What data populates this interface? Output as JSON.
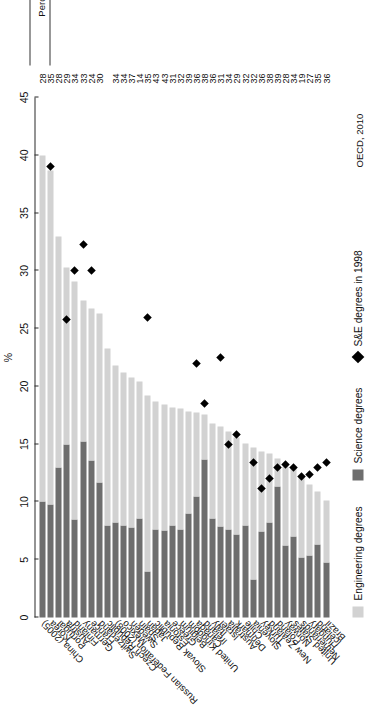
{
  "source_note": "OECD, 2010",
  "axis": {
    "unit": "%",
    "ticks": [
      0,
      5,
      10,
      15,
      20,
      25,
      30,
      35,
      40,
      45
    ],
    "min": 0,
    "max": 45
  },
  "legend": {
    "items": [
      {
        "label": "Engineering degrees",
        "marker": "light-square",
        "color": "#d2d2d2"
      },
      {
        "label": "Science degrees",
        "marker": "dark-square",
        "color": "#6e6e6e"
      },
      {
        "label": "S&E degrees in 1998",
        "marker": "diamond",
        "color": "#000000"
      }
    ]
  },
  "value_column": {
    "header": "Percentage of S&E degrees awarded to women"
  },
  "chart_data": {
    "type": "bar",
    "orientation": "horizontal-stacked",
    "title": "",
    "xlabel": "%",
    "ylabel": "",
    "xlim": [
      0,
      45
    ],
    "grid": false,
    "legend_position": "bottom-left",
    "categories": [
      "China (2005)",
      "Korea",
      "Portugal",
      "Austria",
      "Finland",
      "Germany",
      "France",
      "Switzerland",
      "Czech Republic",
      "Russian Federation (2008)",
      "Mexico",
      "Sweden",
      "Spain",
      "Japan",
      "Slovak Republic",
      "Estonia",
      "Greece",
      "Belgium",
      "United Kingdom",
      "Canada",
      "Ireland",
      "Italy",
      "Israel",
      "Australia",
      "Denmark",
      "Chile",
      "Slovenia",
      "Turkey",
      "New Zealand",
      "Poland",
      "Norway",
      "United States",
      "Netherlands",
      "Hungary",
      "Iceland",
      "Brazil"
    ],
    "series": [
      {
        "name": "Science degrees",
        "color": "#6e6e6e",
        "values": [
          10.0,
          9.8,
          13.0,
          15.0,
          8.5,
          15.2,
          13.6,
          11.7,
          8.0,
          8.2,
          8.0,
          7.8,
          8.6,
          4.0,
          7.6,
          7.5,
          8.0,
          7.6,
          9.0,
          10.5,
          13.7,
          8.6,
          7.9,
          7.6,
          7.2,
          8.0,
          3.3,
          7.4,
          8.2,
          11.3,
          6.2,
          7.0,
          5.2,
          5.4,
          6.3,
          4.8
        ]
      },
      {
        "name": "Engineering degrees",
        "color": "#d2d2d2",
        "values": [
          30.0,
          28.9,
          20.0,
          15.3,
          20.6,
          12.2,
          13.1,
          14.6,
          15.3,
          13.6,
          13.2,
          13.0,
          11.8,
          15.2,
          11.1,
          10.9,
          10.2,
          10.5,
          8.8,
          7.2,
          3.9,
          8.2,
          8.6,
          8.5,
          8.4,
          7.1,
          11.4,
          7.0,
          6.0,
          2.5,
          6.9,
          5.9,
          7.1,
          6.1,
          4.6,
          5.3
        ]
      }
    ],
    "markers_1998": {
      "name": "S&E degrees in 1998",
      "symbol": "diamond",
      "color": "#000000",
      "values": [
        null,
        39.0,
        null,
        25.8,
        30.0,
        32.3,
        30.0,
        null,
        null,
        null,
        null,
        null,
        null,
        26.0,
        null,
        null,
        null,
        null,
        null,
        22.0,
        18.5,
        null,
        22.5,
        15.0,
        15.8,
        null,
        13.4,
        11.2,
        12.0,
        13.0,
        13.2,
        13.0,
        12.2,
        12.4,
        13.0,
        13.4
      ]
    },
    "value_labels": {
      "header": "Percentage of S&E degrees awarded to women",
      "values": [
        28,
        35,
        28,
        29,
        34,
        33,
        24,
        30,
        null,
        34,
        34,
        37,
        14,
        35,
        43,
        43,
        31,
        32,
        39,
        36,
        38,
        36,
        31,
        34,
        29,
        32,
        32,
        36,
        38,
        39,
        28,
        34,
        19,
        27,
        35,
        36
      ]
    }
  }
}
